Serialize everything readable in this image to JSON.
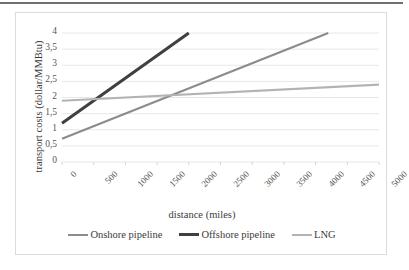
{
  "figure": {
    "background_color": "#ffffff",
    "border_color": "#dcdcdc",
    "top_rule_color": "#6f6f6f"
  },
  "chart_data": {
    "type": "line",
    "title": "",
    "xlabel": "distance (miles)",
    "ylabel": "transport costs (dollar/MMBtu)",
    "xlim": [
      0,
      5000
    ],
    "ylim": [
      0,
      4
    ],
    "xticks": [
      0,
      500,
      1000,
      1500,
      2000,
      2500,
      3000,
      3500,
      4000,
      4500,
      5000
    ],
    "xtick_labels": [
      "0",
      "500",
      "1000",
      "1500",
      "2000",
      "2500",
      "3000",
      "3500",
      "4000",
      "4500",
      "5000"
    ],
    "yticks": [
      0,
      0.5,
      1,
      1.5,
      2,
      2.5,
      3,
      3.5,
      4
    ],
    "ytick_labels": [
      "0",
      "0,5",
      "1",
      "1,5",
      "2",
      "2,5",
      "3",
      "3,5",
      "4"
    ],
    "grid": true,
    "grid_axis": "y",
    "grid_color": "#e8e8e8",
    "legend_position": "bottom",
    "series": [
      {
        "name": "Onshore pipeline",
        "color": "#8c8c8c",
        "width": 2.2,
        "x": [
          0,
          4200
        ],
        "y": [
          0.72,
          4.0
        ]
      },
      {
        "name": "Offshore pipeline",
        "color": "#404040",
        "width": 3.0,
        "x": [
          0,
          2000
        ],
        "y": [
          1.2,
          4.0
        ]
      },
      {
        "name": "LNG",
        "color": "#b3b3b3",
        "width": 2.2,
        "x": [
          0,
          5000
        ],
        "y": [
          1.9,
          2.4
        ]
      }
    ]
  }
}
